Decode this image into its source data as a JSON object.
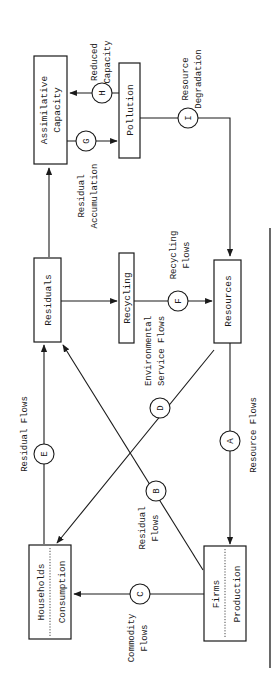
{
  "diagram": {
    "orientation": "rotated-90-ccw",
    "nodes": {
      "assimilative_capacity": {
        "line1": "Assimilative",
        "line2": "Capacity"
      },
      "pollution": {
        "label": "Pollution"
      },
      "residuals": {
        "label": "Residuals"
      },
      "recycling": {
        "label": "Recycling"
      },
      "resources": {
        "label": "Resources"
      },
      "households": {
        "top": "Households",
        "bottom": "Consumption"
      },
      "firms": {
        "top": "Firms",
        "bottom": "Production"
      }
    },
    "flows": {
      "A": {
        "letter": "A",
        "label": "Resource Flows"
      },
      "B": {
        "letter": "B",
        "line1": "Residual",
        "line2": "Flows"
      },
      "C": {
        "letter": "C",
        "line1": "Commodity",
        "line2": "Flows"
      },
      "D": {
        "letter": "D",
        "line1": "Environmental",
        "line2": "Service Flows"
      },
      "E": {
        "letter": "E",
        "label": "Residual Flows"
      },
      "F": {
        "letter": "F",
        "line1": "Recycling",
        "line2": "Flows"
      },
      "G": {
        "letter": "G",
        "line1": "Residual",
        "line2": "Accumulation"
      },
      "H": {
        "letter": "H",
        "line1": "Reduced",
        "line2": "Capacity"
      },
      "I": {
        "letter": "I",
        "line1": "Resource",
        "line2": "Degradation"
      }
    },
    "colors": {
      "ink": "#1a1a1a",
      "background": "#ffffff"
    }
  }
}
